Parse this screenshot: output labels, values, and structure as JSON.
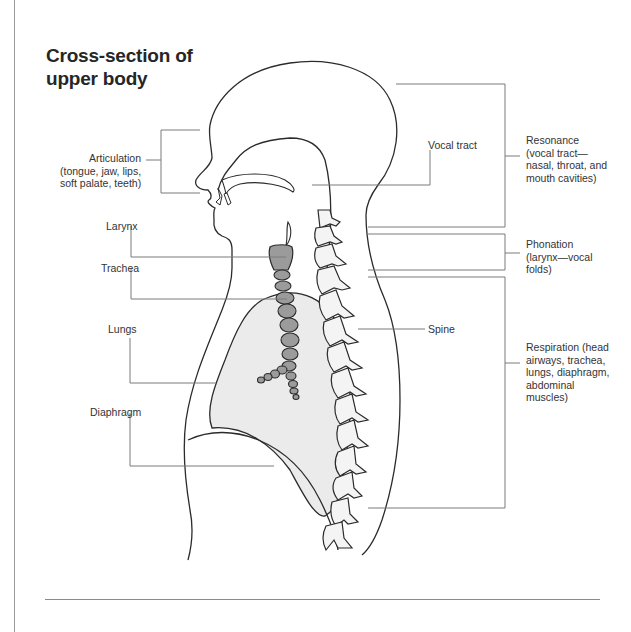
{
  "title": {
    "line1": "Cross-section of",
    "line2": "upper body"
  },
  "labels_left": {
    "articulation": {
      "heading": "Articulation",
      "line2": "(tongue, jaw, lips,",
      "line3": "soft palate, teeth)"
    },
    "larynx": "Larynx",
    "trachea": "Trachea",
    "lungs": "Lungs",
    "diaphragm": "Diaphragm"
  },
  "labels_center": {
    "vocal_tract": "Vocal tract",
    "spine": "Spine"
  },
  "labels_right": {
    "resonance": {
      "line1": "Resonance",
      "line2": "(vocal tract—",
      "line3": "nasal, throat, and",
      "line4": "mouth cavities)"
    },
    "phonation": {
      "line1": "Phonation",
      "line2": "(larynx—vocal",
      "line3": "folds)"
    },
    "respiration": {
      "line1": "Respiration (head",
      "line2": "airways, trachea,",
      "line3": "lungs, diaphragm,",
      "line4": "abdominal",
      "line5": "muscles)"
    }
  },
  "colors": {
    "outline": "#2b2b2b",
    "leader_line": "#7a7a7a",
    "lung_fill": "#e9e9e9",
    "trachea_fill": "#9b9b9b",
    "vertebra_fill": "#f4f4f4"
  }
}
